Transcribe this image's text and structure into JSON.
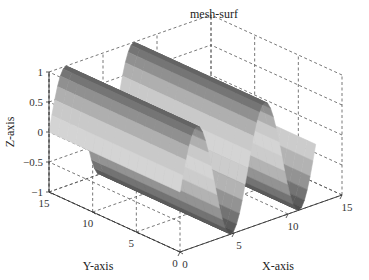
{
  "chart_data": {
    "type": "surface",
    "title": "mesh-surf",
    "xlabel": "X-axis",
    "ylabel": "Y-axis",
    "zlabel": "Z-axis",
    "function": "z = sin(x)",
    "x_range": [
      0,
      12.566
    ],
    "y_range": [
      0,
      15
    ],
    "xlim": [
      0,
      15
    ],
    "ylim": [
      0,
      15
    ],
    "zlim": [
      -1,
      1
    ],
    "xticks": [
      0,
      5,
      10,
      15
    ],
    "yticks": [
      0,
      5,
      10,
      15
    ],
    "zticks": [
      -1,
      -0.5,
      0,
      0.5,
      1
    ],
    "xtick_labels": [
      "0",
      "5",
      "10",
      "15"
    ],
    "ytick_labels": [
      "0",
      "5",
      "10",
      "15"
    ],
    "ztick_labels": [
      "-1",
      "-0.5",
      "0",
      "0.5",
      "1"
    ],
    "grid": true,
    "colormap": "gray",
    "shading": "faceted-flat"
  }
}
